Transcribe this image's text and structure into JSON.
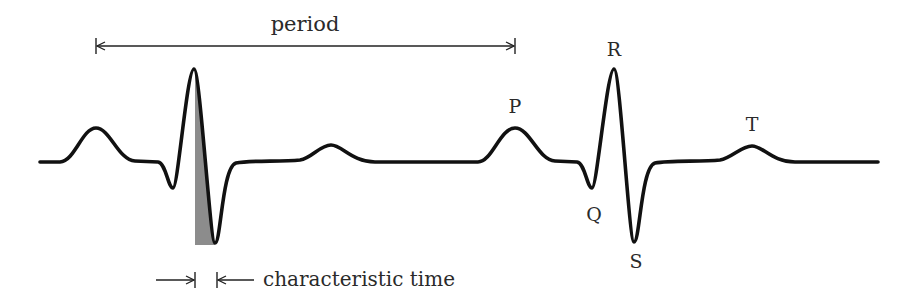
{
  "diagram": {
    "type": "ecg-waveform",
    "colors": {
      "trace": "#111111",
      "shade": "#8c8c8c",
      "text": "#2a2a2a",
      "background": "#ffffff"
    },
    "labels": {
      "period": "period",
      "characteristic_time": "characteristic time",
      "P": "P",
      "Q": "Q",
      "R": "R",
      "S": "S",
      "T": "T"
    },
    "annotations": [
      {
        "id": "period-arrow",
        "from_x": 96,
        "to_x": 515,
        "y": 46,
        "label": "period",
        "style": "double-headed with end bars"
      },
      {
        "id": "characteristic-time-arrows",
        "left_bar_x": 195,
        "right_bar_x": 217,
        "y": 280,
        "label": "characteristic time",
        "style": "inward-pointing arrows with bars"
      }
    ],
    "waves": [
      {
        "beat": 1,
        "P": {
          "x": 96,
          "y": 128
        },
        "Q": {
          "x": 173,
          "y": 188
        },
        "R": {
          "x": 194,
          "y": 69
        },
        "S": {
          "x": 215,
          "y": 243
        },
        "T": {
          "x": 331,
          "y": 145
        }
      },
      {
        "beat": 2,
        "P": {
          "x": 515,
          "y": 128
        },
        "Q": {
          "x": 592,
          "y": 188
        },
        "R": {
          "x": 614,
          "y": 69
        },
        "S": {
          "x": 634,
          "y": 242
        },
        "T": {
          "x": 752,
          "y": 146
        }
      }
    ],
    "baseline_y": 162
  }
}
